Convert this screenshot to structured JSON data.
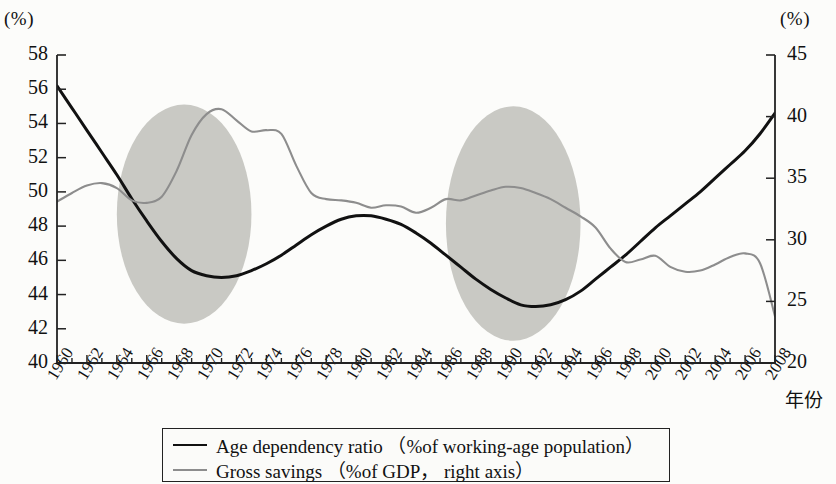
{
  "axes": {
    "left_unit": "(%)",
    "right_unit": "(%)",
    "x_title": "年份",
    "left_ticks": [
      "58",
      "56",
      "54",
      "52",
      "50",
      "48",
      "46",
      "44",
      "42",
      "40"
    ],
    "right_ticks": [
      "45",
      "40",
      "35",
      "30",
      "25",
      "20"
    ],
    "x_labels": [
      "1960",
      "1962",
      "1964",
      "1966",
      "1968",
      "1970",
      "1972",
      "1974",
      "1976",
      "1978",
      "1980",
      "1982",
      "1984",
      "1986",
      "1988",
      "1990",
      "1992",
      "1994",
      "1996",
      "1998",
      "2000",
      "2002",
      "2004",
      "2006",
      "2008"
    ]
  },
  "legend": {
    "series1": "Age dependency ratio （%of working-age population）",
    "series2": "Gross savings （%of GDP， right axis）"
  },
  "colors": {
    "series1": "#111111",
    "series2": "#8d8d8d",
    "highlight": "#c9c9c4",
    "axis": "#222222"
  },
  "chart_data": {
    "type": "line",
    "title": "",
    "xlabel": "年份",
    "ylabel": "(%)",
    "y2label": "(%)",
    "ylim": [
      40,
      58
    ],
    "y2lim": [
      20,
      45
    ],
    "xlim": [
      1960,
      2008
    ],
    "grid": false,
    "legend_position": "bottom",
    "x": [
      1960,
      1961,
      1962,
      1963,
      1964,
      1965,
      1966,
      1967,
      1968,
      1969,
      1970,
      1971,
      1972,
      1973,
      1974,
      1975,
      1976,
      1977,
      1978,
      1979,
      1980,
      1981,
      1982,
      1983,
      1984,
      1985,
      1986,
      1987,
      1988,
      1989,
      1990,
      1991,
      1992,
      1993,
      1994,
      1995,
      1996,
      1997,
      1998,
      1999,
      2000,
      2001,
      2002,
      2003,
      2004,
      2005,
      2006,
      2007,
      2008
    ],
    "series": [
      {
        "name": "Age dependency ratio （%of working-age population）",
        "axis": "left",
        "unit": "%",
        "color": "#111111",
        "values": [
          56.2,
          54.9,
          53.6,
          52.3,
          51.0,
          49.6,
          48.3,
          47.1,
          46.1,
          45.4,
          45.1,
          45.0,
          45.1,
          45.4,
          45.8,
          46.3,
          46.9,
          47.5,
          48.0,
          48.4,
          48.6,
          48.6,
          48.4,
          48.1,
          47.6,
          47.0,
          46.3,
          45.6,
          44.9,
          44.3,
          43.8,
          43.4,
          43.3,
          43.4,
          43.7,
          44.2,
          44.9,
          45.6,
          46.3,
          47.1,
          47.9,
          48.6,
          49.3,
          50.0,
          50.8,
          51.6,
          52.4,
          53.4,
          54.6
        ]
      },
      {
        "name": "Gross savings （%of GDP， right axis）",
        "axis": "right",
        "unit": "%",
        "color": "#8d8d8d",
        "values": [
          33.1,
          33.8,
          34.4,
          34.6,
          34.2,
          33.2,
          33.0,
          33.5,
          35.6,
          38.5,
          40.2,
          40.6,
          39.7,
          38.8,
          38.9,
          38.6,
          36.0,
          33.8,
          33.3,
          33.2,
          33.0,
          32.6,
          32.8,
          32.7,
          32.2,
          32.6,
          33.3,
          33.2,
          33.6,
          34.0,
          34.3,
          34.2,
          33.8,
          33.3,
          32.6,
          31.9,
          31.0,
          29.3,
          28.2,
          28.4,
          28.7,
          27.8,
          27.4,
          27.5,
          28.0,
          28.6,
          28.9,
          28.1,
          23.8
        ]
      }
    ],
    "highlight_regions": [
      {
        "label": "highlight-ellipse-1",
        "x_range": [
          1964,
          1973
        ],
        "y_range": [
          42.3,
          55.1
        ]
      },
      {
        "label": "highlight-ellipse-2",
        "x_range": [
          1986,
          1995
        ],
        "y_range": [
          41.3,
          55.0
        ]
      }
    ]
  }
}
